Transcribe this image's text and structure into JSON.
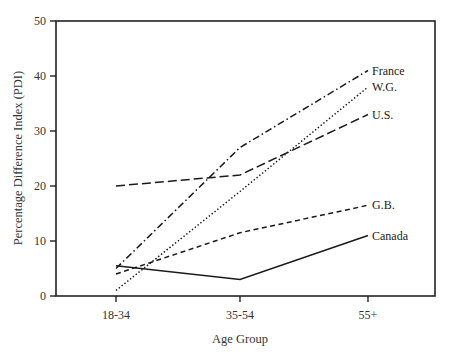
{
  "chart_data": {
    "type": "line",
    "title": "",
    "xlabel": "Age Group",
    "ylabel": "Percentage Difference Index (PDI)",
    "categories": [
      "18-34",
      "35-54",
      "55+"
    ],
    "ylim": [
      0,
      50
    ],
    "yticks": [
      0,
      10,
      20,
      30,
      40,
      50
    ],
    "grid": false,
    "legend": "inline labels at line ends",
    "series": [
      {
        "name": "France",
        "values": [
          5,
          27,
          41
        ],
        "style": "dash-dot"
      },
      {
        "name": "W.G.",
        "values": [
          1,
          19,
          38
        ],
        "style": "dotted"
      },
      {
        "name": "U.S.",
        "values": [
          20,
          22,
          33
        ],
        "style": "long-dash"
      },
      {
        "name": "G.B.",
        "values": [
          4,
          11.5,
          16.5
        ],
        "style": "short-dash"
      },
      {
        "name": "Canada",
        "values": [
          5.5,
          3,
          11
        ],
        "style": "solid"
      }
    ]
  }
}
